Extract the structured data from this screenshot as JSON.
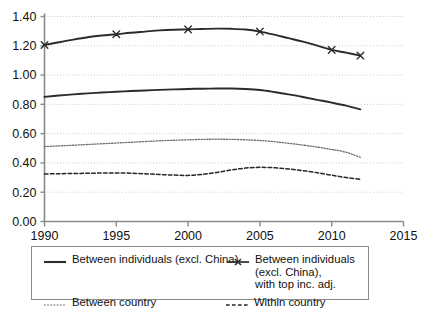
{
  "chart_data": {
    "type": "line",
    "title": "",
    "subtitle": "",
    "xlabel": "",
    "ylabel": "",
    "xlim": [
      1990,
      2015
    ],
    "ylim": [
      0.0,
      1.4
    ],
    "grid": true,
    "grid_axis": "y",
    "legend_position": "bottom",
    "x_ticks": [
      1990,
      1995,
      2000,
      2005,
      2010,
      2015
    ],
    "x_tick_labels": [
      "1990",
      "1995",
      "2000",
      "2005",
      "2010",
      "2015"
    ],
    "y_ticks": [
      0.0,
      0.2,
      0.4,
      0.6,
      0.8,
      1.0,
      1.2,
      1.4
    ],
    "y_tick_labels": [
      "0.00",
      "0.20",
      "0.40",
      "0.60",
      "0.80",
      "1.00",
      "1.20",
      "1.40"
    ],
    "x": [
      1990,
      1991,
      1992,
      1993,
      1994,
      1995,
      1996,
      1997,
      1998,
      1999,
      2000,
      2001,
      2002,
      2003,
      2004,
      2005,
      2006,
      2007,
      2008,
      2009,
      2010,
      2011,
      2012
    ],
    "series": [
      {
        "name": "Between individuals (excl. China)",
        "style": "solid",
        "marker": "none",
        "color": "#2b2b2b",
        "width": 1.9,
        "values": [
          0.851,
          0.86,
          0.868,
          0.875,
          0.881,
          0.886,
          0.891,
          0.895,
          0.899,
          0.902,
          0.905,
          0.907,
          0.908,
          0.908,
          0.905,
          0.898,
          0.884,
          0.868,
          0.85,
          0.831,
          0.812,
          0.791,
          0.766
        ]
      },
      {
        "name": "Between individuals (excl. China), with top inc. adj.",
        "style": "solid",
        "marker": "x",
        "color": "#2b2b2b",
        "width": 1.9,
        "marker_years": [
          1990,
          1995,
          2000,
          2005,
          2010,
          2012
        ],
        "marker_values": [
          1.205,
          1.279,
          1.312,
          1.297,
          1.172,
          1.133
        ],
        "values": [
          1.205,
          1.224,
          1.242,
          1.258,
          1.27,
          1.279,
          1.289,
          1.297,
          1.305,
          1.31,
          1.312,
          1.315,
          1.317,
          1.316,
          1.311,
          1.297,
          1.276,
          1.252,
          1.228,
          1.201,
          1.172,
          1.153,
          1.133
        ]
      },
      {
        "name": "Between country",
        "style": "dotted",
        "marker": "none",
        "color": "#6e6e6e",
        "width": 1.3,
        "values": [
          0.512,
          0.516,
          0.521,
          0.526,
          0.531,
          0.536,
          0.541,
          0.546,
          0.551,
          0.555,
          0.558,
          0.561,
          0.562,
          0.561,
          0.558,
          0.553,
          0.545,
          0.534,
          0.522,
          0.508,
          0.492,
          0.473,
          0.438
        ]
      },
      {
        "name": "Within country",
        "style": "dashed",
        "marker": "none",
        "color": "#262626",
        "width": 1.5,
        "values": [
          0.325,
          0.326,
          0.328,
          0.329,
          0.331,
          0.332,
          0.33,
          0.326,
          0.321,
          0.317,
          0.315,
          0.322,
          0.335,
          0.352,
          0.365,
          0.37,
          0.367,
          0.359,
          0.347,
          0.333,
          0.316,
          0.3,
          0.288
        ]
      }
    ]
  },
  "legend": {
    "entries": [
      {
        "label": "Between individuals (excl. China)",
        "style": "solid",
        "marker": "none"
      },
      {
        "label": "Between individuals (excl. China), with top inc. adj.",
        "style": "solid",
        "marker": "x"
      },
      {
        "label": "Between country",
        "style": "dotted",
        "marker": "none"
      },
      {
        "label": "Within country",
        "style": "dashed",
        "marker": "none"
      }
    ],
    "entry_1_label": "Between individuals (excl. China)",
    "entry_2_label_line1": "Between individuals (excl. China),",
    "entry_2_label_line2": "with top inc. adj.",
    "entry_3_label": "Between country",
    "entry_4_label": "Within country"
  },
  "colors": {
    "axis": "#8a8a8a",
    "grid": "#c9c9c9",
    "series_dark": "#2b2b2b",
    "series_grey": "#6e6e6e",
    "background": "#ffffff",
    "legend_border": "#8a8a8a"
  }
}
